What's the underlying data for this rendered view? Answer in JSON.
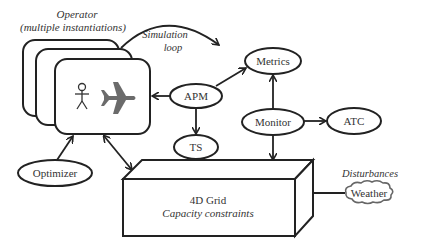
{
  "operator": {
    "title": "Operator",
    "subtitle": "(multiple instantiations)",
    "icons": [
      "person-icon",
      "airplane-icon"
    ]
  },
  "simulation_loop": {
    "line1": "Simulation",
    "line2": "loop"
  },
  "nodes": {
    "apm": "APM",
    "ts": "TS",
    "metrics": "Metrics",
    "monitor": "Monitor",
    "atc": "ATC",
    "optimizer": "Optimizer",
    "weather": "Weather"
  },
  "grid": {
    "title": "4D Grid",
    "subtitle": "Capacity constraints"
  },
  "disturbances": "Disturbances",
  "edges": [
    {
      "from": "APM",
      "to": "Operator"
    },
    {
      "from": "APM",
      "to": "TS"
    },
    {
      "from": "APM",
      "to": "Metrics"
    },
    {
      "from": "Monitor",
      "to": "Metrics"
    },
    {
      "from": "Monitor",
      "to": "ATC"
    },
    {
      "from": "Monitor",
      "to": "4D Grid"
    },
    {
      "from": "TS",
      "to": "4D Grid",
      "bidirectional": true
    },
    {
      "from": "Operator",
      "to": "4D Grid",
      "bidirectional": true
    },
    {
      "from": "Optimizer",
      "to": "Operator"
    },
    {
      "from": "Weather",
      "to": "4D Grid"
    },
    {
      "from": "Operator",
      "to": "Metrics",
      "label": "Simulation loop"
    }
  ],
  "colors": {
    "stroke": "#222222",
    "text": "#333333",
    "airplane": "#6b6b6b"
  }
}
